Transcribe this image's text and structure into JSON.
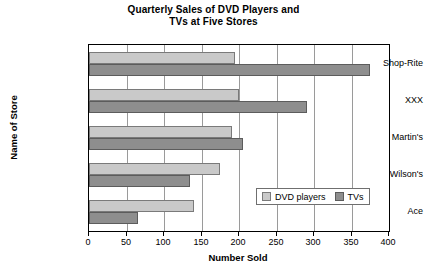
{
  "chart_data": {
    "type": "bar",
    "orientation": "horizontal",
    "title": "Quarterly Sales of DVD Players and",
    "title_line2": "TVs at Five Stores",
    "xlabel": "Number Sold",
    "ylabel": "Name of Store",
    "categories": [
      "Ace",
      "Wilson's",
      "Martin's",
      "XXX",
      "Shop-Rite"
    ],
    "series": [
      {
        "name": "DVD players",
        "color": "#c9c9c9",
        "values": [
          140,
          175,
          190,
          200,
          195
        ]
      },
      {
        "name": "TVs",
        "color": "#8e8e8e",
        "values": [
          65,
          135,
          205,
          290,
          375
        ]
      }
    ],
    "xlim": [
      0,
      400
    ],
    "xticks": [
      0,
      50,
      100,
      150,
      200,
      250,
      300,
      350,
      400
    ],
    "xtick_labels": [
      "0",
      "50",
      "100",
      "150",
      "200",
      "250",
      "300",
      "350",
      "400"
    ],
    "grid": true,
    "grid_axis": "x",
    "legend_position": "lower-right-inside",
    "legend_entries": [
      {
        "label": "DVD players",
        "swatch": "light-gray"
      },
      {
        "label": "TVs",
        "swatch": "dark-gray"
      }
    ]
  }
}
